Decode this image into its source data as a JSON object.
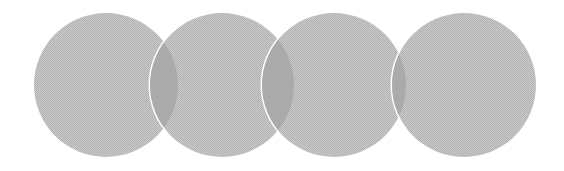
{
  "diagram": {
    "type": "overlapping-circles",
    "circle_count": 4,
    "colors": {
      "background": "#ffffff",
      "circle_fill": "#b4b4b4",
      "circle_fill_light": "#c8c8c8",
      "overlap_fill": "#9a9a9a",
      "separator_stroke": "#ffffff"
    },
    "circles": [
      {
        "id": "circle-1",
        "cx": 106,
        "cy": 85,
        "r": 72
      },
      {
        "id": "circle-2",
        "cx": 222,
        "cy": 85,
        "r": 72
      },
      {
        "id": "circle-3",
        "cx": 334,
        "cy": 85,
        "r": 72
      },
      {
        "id": "circle-4",
        "cx": 464,
        "cy": 85,
        "r": 72
      }
    ]
  }
}
